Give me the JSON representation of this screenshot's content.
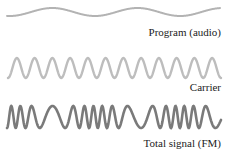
{
  "diagram": {
    "waves": [
      {
        "id": "program",
        "label": "Program (audio)",
        "color": "#b3b3b3",
        "stroke_width": 2,
        "y_center": 12,
        "amplitude": 4,
        "x_start": 7,
        "x_end": 220,
        "cycles": 2.5,
        "phase": -1.57
      },
      {
        "id": "carrier",
        "label": "Carrier",
        "color": "#bdbdbd",
        "stroke_width": 2.4,
        "y_center": 68,
        "amplitude": 10,
        "x_start": 8,
        "x_end": 221,
        "cycles": 12
      },
      {
        "id": "fm",
        "label": "Total signal (FM)",
        "color": "#7a7a7a",
        "stroke_width": 2.6,
        "y_center": 117,
        "amplitude": 11,
        "x_start": 7,
        "x_end": 221,
        "base_cycles": 16,
        "deviation": 0.55
      }
    ]
  }
}
